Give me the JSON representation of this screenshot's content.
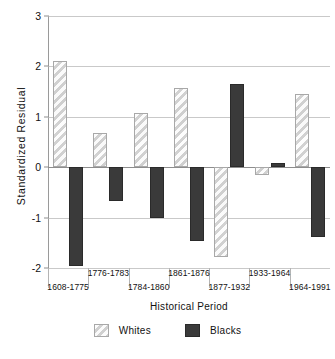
{
  "chart_data": {
    "type": "bar",
    "title": "",
    "xlabel": "Historical Period",
    "ylabel": "Standardized Residual",
    "categories": [
      "1608-1775",
      "1776-1783",
      "1784-1860",
      "1861-1876",
      "1877-1932",
      "1933-1964",
      "1964-1991"
    ],
    "series": [
      {
        "name": "Whites",
        "values": [
          2.1,
          0.68,
          1.07,
          1.57,
          -1.78,
          -0.16,
          1.46
        ],
        "color": "#e4e4e4"
      },
      {
        "name": "Blacks",
        "values": [
          -1.97,
          -0.67,
          -1.0,
          -1.47,
          1.66,
          0.08,
          -1.38
        ],
        "color": "#3a3a3a"
      }
    ],
    "ylim": [
      -2,
      3
    ],
    "yticks": [
      3,
      2,
      1,
      0,
      -1,
      -2
    ],
    "ytick_labels": [
      "3",
      "2",
      "1",
      "0",
      "-1",
      "-2"
    ],
    "grid": true,
    "legend_position": "bottom-center"
  },
  "legend": {
    "entries": [
      {
        "label": "Whites",
        "swatch": "whites-swatch-icon"
      },
      {
        "label": "Blacks",
        "swatch": "blacks-swatch-icon"
      }
    ]
  }
}
